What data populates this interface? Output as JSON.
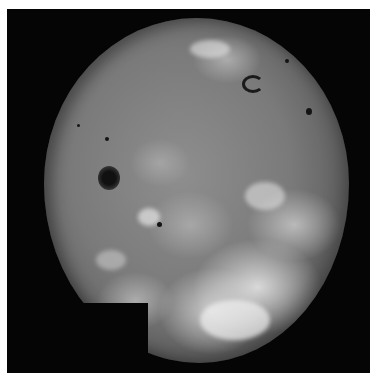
{
  "image": {
    "subject": "grayscale mosaic of a volcanic moon surface on black background",
    "colors": {
      "background": "#050505",
      "surface_mid": "#8e8e8e",
      "surface_bright": "#e6e6e6",
      "surface_dark_spot": "#141414",
      "page_margin": "#ffffff"
    },
    "features": [
      {
        "name": "dark-volcanic-spot-left",
        "x": 108,
        "y": 178
      },
      {
        "name": "dark-horseshoe-feature-top-right",
        "x": 250,
        "y": 82
      },
      {
        "name": "small-dark-spot-center",
        "x": 160,
        "y": 225
      },
      {
        "name": "small-dark-spot-right",
        "x": 308,
        "y": 112
      }
    ]
  }
}
